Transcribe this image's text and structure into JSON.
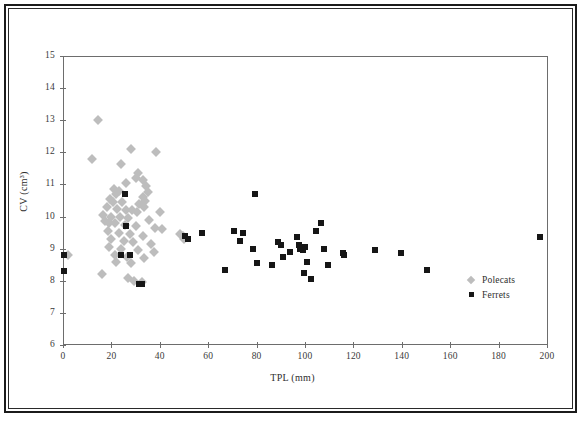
{
  "chart_data": {
    "type": "scatter",
    "title": "",
    "xlabel": "TPL (mm)",
    "ylabel": "CV (cm³)",
    "xlim": [
      0,
      200
    ],
    "ylim": [
      6,
      15
    ],
    "xticks": [
      0,
      20,
      40,
      60,
      80,
      100,
      120,
      140,
      160,
      180,
      200
    ],
    "yticks": [
      6,
      7,
      8,
      9,
      10,
      11,
      12,
      13,
      14,
      15
    ],
    "grid": false,
    "legend_position": "bottom-right",
    "series": [
      {
        "name": "Polecats",
        "marker": "diamond",
        "color": "#bdbdbd",
        "points": [
          [
            14.5,
            13.0
          ],
          [
            12.0,
            11.8
          ],
          [
            28.0,
            12.1
          ],
          [
            38.5,
            12.0
          ],
          [
            24.0,
            11.65
          ],
          [
            31.0,
            11.35
          ],
          [
            30.0,
            11.2
          ],
          [
            33.0,
            11.15
          ],
          [
            26.0,
            11.05
          ],
          [
            34.5,
            10.95
          ],
          [
            21.0,
            10.85
          ],
          [
            23.0,
            10.8
          ],
          [
            22.0,
            10.7
          ],
          [
            35.0,
            10.75
          ],
          [
            33.0,
            10.6
          ],
          [
            34.0,
            10.5
          ],
          [
            19.5,
            10.55
          ],
          [
            20.5,
            10.45
          ],
          [
            24.5,
            10.45
          ],
          [
            31.5,
            10.4
          ],
          [
            33.5,
            10.3
          ],
          [
            18.0,
            10.3
          ],
          [
            22.5,
            10.25
          ],
          [
            26.0,
            10.2
          ],
          [
            28.5,
            10.2
          ],
          [
            30.5,
            10.15
          ],
          [
            40.0,
            10.15
          ],
          [
            16.5,
            10.05
          ],
          [
            20.0,
            10.0
          ],
          [
            23.5,
            10.0
          ],
          [
            27.0,
            9.95
          ],
          [
            35.5,
            9.9
          ],
          [
            17.5,
            9.85
          ],
          [
            19.0,
            9.8
          ],
          [
            21.5,
            9.8
          ],
          [
            25.5,
            9.75
          ],
          [
            30.0,
            9.7
          ],
          [
            38.0,
            9.65
          ],
          [
            41.0,
            9.6
          ],
          [
            18.5,
            9.55
          ],
          [
            23.0,
            9.5
          ],
          [
            27.5,
            9.45
          ],
          [
            33.0,
            9.4
          ],
          [
            20.0,
            9.3
          ],
          [
            25.0,
            9.25
          ],
          [
            29.0,
            9.2
          ],
          [
            36.5,
            9.15
          ],
          [
            19.0,
            9.05
          ],
          [
            24.0,
            9.0
          ],
          [
            31.0,
            8.95
          ],
          [
            37.5,
            8.9
          ],
          [
            2.0,
            8.8
          ],
          [
            21.5,
            8.8
          ],
          [
            26.5,
            8.75
          ],
          [
            33.5,
            8.7
          ],
          [
            22.0,
            8.6
          ],
          [
            28.0,
            8.55
          ],
          [
            16.0,
            8.2
          ],
          [
            27.0,
            8.1
          ],
          [
            29.5,
            8.0
          ],
          [
            32.5,
            7.95
          ],
          [
            48.5,
            9.45
          ],
          [
            49.5,
            9.4
          ],
          [
            50.0,
            9.3
          ]
        ]
      },
      {
        "name": "Ferrets",
        "marker": "square",
        "color": "#161616",
        "points": [
          [
            0.5,
            8.8
          ],
          [
            0.5,
            8.3
          ],
          [
            25.5,
            10.7
          ],
          [
            26.0,
            9.7
          ],
          [
            24.0,
            8.8
          ],
          [
            27.5,
            8.8
          ],
          [
            31.5,
            7.9
          ],
          [
            32.5,
            7.9
          ],
          [
            50.5,
            9.4
          ],
          [
            51.5,
            9.3
          ],
          [
            57.5,
            9.5
          ],
          [
            67.0,
            8.35
          ],
          [
            70.5,
            9.55
          ],
          [
            74.5,
            9.5
          ],
          [
            73.0,
            9.25
          ],
          [
            79.5,
            10.7
          ],
          [
            78.5,
            9.0
          ],
          [
            80.0,
            8.55
          ],
          [
            86.5,
            8.5
          ],
          [
            89.0,
            9.2
          ],
          [
            90.0,
            9.1
          ],
          [
            91.0,
            8.75
          ],
          [
            94.0,
            8.9
          ],
          [
            96.5,
            9.35
          ],
          [
            97.5,
            9.1
          ],
          [
            98.0,
            9.0
          ],
          [
            99.0,
            8.95
          ],
          [
            100.0,
            9.05
          ],
          [
            101.0,
            8.6
          ],
          [
            99.5,
            8.25
          ],
          [
            102.5,
            8.05
          ],
          [
            104.5,
            9.55
          ],
          [
            106.5,
            9.8
          ],
          [
            108.0,
            9.0
          ],
          [
            109.5,
            8.5
          ],
          [
            115.5,
            8.85
          ],
          [
            116.0,
            8.8
          ],
          [
            129.0,
            8.95
          ],
          [
            139.5,
            8.85
          ],
          [
            150.5,
            8.35
          ],
          [
            197.0,
            9.35
          ]
        ]
      }
    ]
  },
  "legend": {
    "entries": [
      {
        "label": "Polecats",
        "marker": "diamond-icon"
      },
      {
        "label": "Ferrets",
        "marker": "square-icon"
      }
    ]
  }
}
